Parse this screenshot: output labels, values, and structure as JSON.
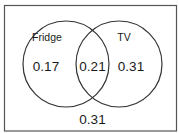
{
  "diagram": {
    "type": "venn",
    "sets": [
      {
        "name": "Fridge",
        "only_value": "0.17"
      },
      {
        "name": "TV",
        "only_value": "0.31"
      }
    ],
    "intersection_value": "0.21",
    "outside_value": "0.31",
    "colors": {
      "stroke": "#333333",
      "background": "#ffffff",
      "text": "#1a1a1a"
    }
  }
}
